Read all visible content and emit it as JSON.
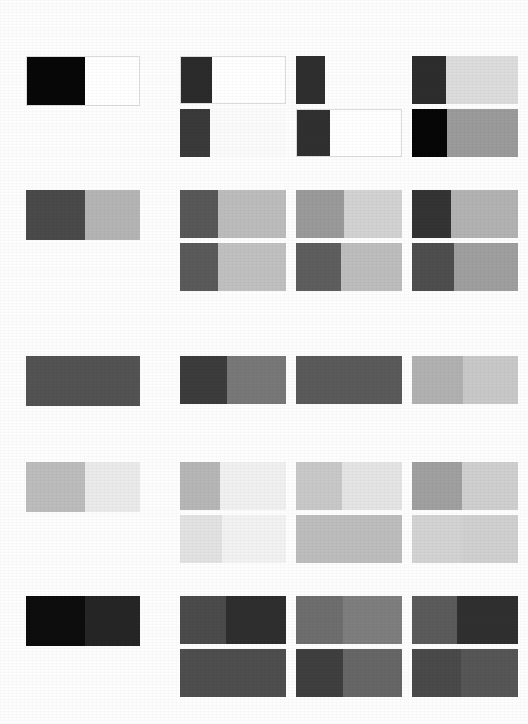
{
  "page": {
    "background_color": "#fdfdfd",
    "width": 528,
    "height": 724
  },
  "layout": {
    "reference_left": 26,
    "reference_width": 114,
    "reference_height": 50,
    "grid_left": 180,
    "cell_width": 106,
    "cell_height": 48,
    "column_gap": 10,
    "sub_row_gap": 5
  },
  "groups": [
    {
      "id": "group-1",
      "name": "black-white-group",
      "top": 56,
      "reference": {
        "name": "reference-swatch-1",
        "left_color": "#080808",
        "right_color": "#ffffff",
        "split": 52,
        "outlined": true
      },
      "cells": [
        {
          "name": "cell-1-1",
          "row": 0,
          "col": 0,
          "left_color": "#2b2b2b",
          "right_color": "#ffffff",
          "split": 30,
          "outlined": true,
          "visible": true
        },
        {
          "name": "cell-1-2",
          "row": 0,
          "col": 1,
          "left_color": "#2f2f2f",
          "right_color": "#fdfdfd",
          "split": 27,
          "outlined": false,
          "visible": true
        },
        {
          "name": "cell-1-3",
          "row": 0,
          "col": 2,
          "left_color": "#2d2d2d",
          "right_color": "#dcdcdc",
          "split": 32,
          "outlined": false,
          "visible": true
        },
        {
          "name": "cell-1-4",
          "row": 1,
          "col": 0,
          "left_color": "#3a3a3a",
          "right_color": "#fbfbfb",
          "split": 28,
          "outlined": false,
          "visible": true
        },
        {
          "name": "cell-1-5",
          "row": 1,
          "col": 1,
          "left_color": "#303030",
          "right_color": "#ffffff",
          "split": 32,
          "outlined": true,
          "visible": true
        },
        {
          "name": "cell-1-6",
          "row": 1,
          "col": 2,
          "left_color": "#060606",
          "right_color": "#9b9b9b",
          "split": 33,
          "outlined": false,
          "visible": true
        }
      ]
    },
    {
      "id": "group-2",
      "name": "dark-mid-gray-group",
      "top": 190,
      "reference": {
        "name": "reference-swatch-2",
        "left_color": "#4a4a4a",
        "right_color": "#b4b4b4",
        "split": 52,
        "outlined": false
      },
      "cells": [
        {
          "name": "cell-2-1",
          "row": 0,
          "col": 0,
          "left_color": "#585858",
          "right_color": "#bcbcbc",
          "split": 36,
          "outlined": false,
          "visible": true
        },
        {
          "name": "cell-2-2",
          "row": 0,
          "col": 1,
          "left_color": "#9a9a9a",
          "right_color": "#d2d2d2",
          "split": 45,
          "outlined": false,
          "visible": true
        },
        {
          "name": "cell-2-3",
          "row": 0,
          "col": 2,
          "left_color": "#343434",
          "right_color": "#b2b2b2",
          "split": 37,
          "outlined": false,
          "visible": true
        },
        {
          "name": "cell-2-4",
          "row": 1,
          "col": 0,
          "left_color": "#5a5a5a",
          "right_color": "#c0c0c0",
          "split": 36,
          "outlined": false,
          "visible": true
        },
        {
          "name": "cell-2-5",
          "row": 1,
          "col": 1,
          "left_color": "#5e5e5e",
          "right_color": "#bdbdbd",
          "split": 42,
          "outlined": false,
          "visible": true
        },
        {
          "name": "cell-2-6",
          "row": 1,
          "col": 2,
          "left_color": "#4e4e4e",
          "right_color": "#9f9f9f",
          "split": 40,
          "outlined": false,
          "visible": true
        }
      ]
    },
    {
      "id": "group-3",
      "name": "solid-mid-gray-group",
      "top": 356,
      "reference": {
        "name": "reference-swatch-3",
        "left_color": "#535353",
        "right_color": "#535353",
        "split": 50,
        "outlined": false
      },
      "cells": [
        {
          "name": "cell-3-1",
          "row": 0,
          "col": 0,
          "left_color": "#3c3c3c",
          "right_color": "#787878",
          "split": 44,
          "outlined": false,
          "visible": true
        },
        {
          "name": "cell-3-2",
          "row": 0,
          "col": 1,
          "left_color": "#5a5a5a",
          "right_color": "#5a5a5a",
          "split": 50,
          "outlined": false,
          "visible": true
        },
        {
          "name": "cell-3-3",
          "row": 0,
          "col": 2,
          "left_color": "#b1b1b1",
          "right_color": "#c8c8c8",
          "split": 48,
          "outlined": false,
          "visible": true
        },
        {
          "name": "cell-3-4",
          "row": 1,
          "col": 0,
          "left_color": "#ffffff",
          "right_color": "#ffffff",
          "split": 50,
          "outlined": false,
          "visible": false
        },
        {
          "name": "cell-3-5",
          "row": 1,
          "col": 1,
          "left_color": "#ffffff",
          "right_color": "#ffffff",
          "split": 50,
          "outlined": false,
          "visible": false
        },
        {
          "name": "cell-3-6",
          "row": 1,
          "col": 2,
          "left_color": "#ffffff",
          "right_color": "#ffffff",
          "split": 50,
          "outlined": false,
          "visible": false
        }
      ]
    },
    {
      "id": "group-4",
      "name": "light-gray-group",
      "top": 462,
      "reference": {
        "name": "reference-swatch-4",
        "left_color": "#bcbcbc",
        "right_color": "#eaeaea",
        "split": 52,
        "outlined": false
      },
      "cells": [
        {
          "name": "cell-4-1",
          "row": 0,
          "col": 0,
          "left_color": "#b6b6b6",
          "right_color": "#f0f0f0",
          "split": 38,
          "outlined": false,
          "visible": true
        },
        {
          "name": "cell-4-2",
          "row": 0,
          "col": 1,
          "left_color": "#c8c8c8",
          "right_color": "#e4e4e4",
          "split": 43,
          "outlined": false,
          "visible": true
        },
        {
          "name": "cell-4-3",
          "row": 0,
          "col": 2,
          "left_color": "#a0a0a0",
          "right_color": "#cfcfcf",
          "split": 47,
          "outlined": false,
          "visible": true
        },
        {
          "name": "cell-4-4",
          "row": 1,
          "col": 0,
          "left_color": "#e2e2e2",
          "right_color": "#f2f2f2",
          "split": 40,
          "outlined": false,
          "visible": true
        },
        {
          "name": "cell-4-5",
          "row": 1,
          "col": 1,
          "left_color": "#bdbdbd",
          "right_color": "#bdbdbd",
          "split": 50,
          "outlined": false,
          "visible": true
        },
        {
          "name": "cell-4-6",
          "row": 1,
          "col": 2,
          "left_color": "#d3d3d3",
          "right_color": "#d0d0d0",
          "split": 47,
          "outlined": false,
          "visible": true
        }
      ]
    },
    {
      "id": "group-5",
      "name": "near-black-group",
      "top": 596,
      "reference": {
        "name": "reference-swatch-5",
        "left_color": "#0d0d0d",
        "right_color": "#262626",
        "split": 52,
        "outlined": false
      },
      "cells": [
        {
          "name": "cell-5-1",
          "row": 0,
          "col": 0,
          "left_color": "#4b4b4b",
          "right_color": "#2e2e2e",
          "split": 43,
          "outlined": false,
          "visible": true
        },
        {
          "name": "cell-5-2",
          "row": 0,
          "col": 1,
          "left_color": "#6e6e6e",
          "right_color": "#7e7e7e",
          "split": 44,
          "outlined": false,
          "visible": true
        },
        {
          "name": "cell-5-3",
          "row": 0,
          "col": 2,
          "left_color": "#5b5b5b",
          "right_color": "#303030",
          "split": 42,
          "outlined": false,
          "visible": true
        },
        {
          "name": "cell-5-4",
          "row": 1,
          "col": 0,
          "left_color": "#4e4e4e",
          "right_color": "#4e4e4e",
          "split": 50,
          "outlined": false,
          "visible": true
        },
        {
          "name": "cell-5-5",
          "row": 1,
          "col": 1,
          "left_color": "#3f3f3f",
          "right_color": "#666666",
          "split": 44,
          "outlined": false,
          "visible": true
        },
        {
          "name": "cell-5-6",
          "row": 1,
          "col": 2,
          "left_color": "#4a4a4a",
          "right_color": "#565656",
          "split": 46,
          "outlined": false,
          "visible": true
        }
      ]
    }
  ]
}
